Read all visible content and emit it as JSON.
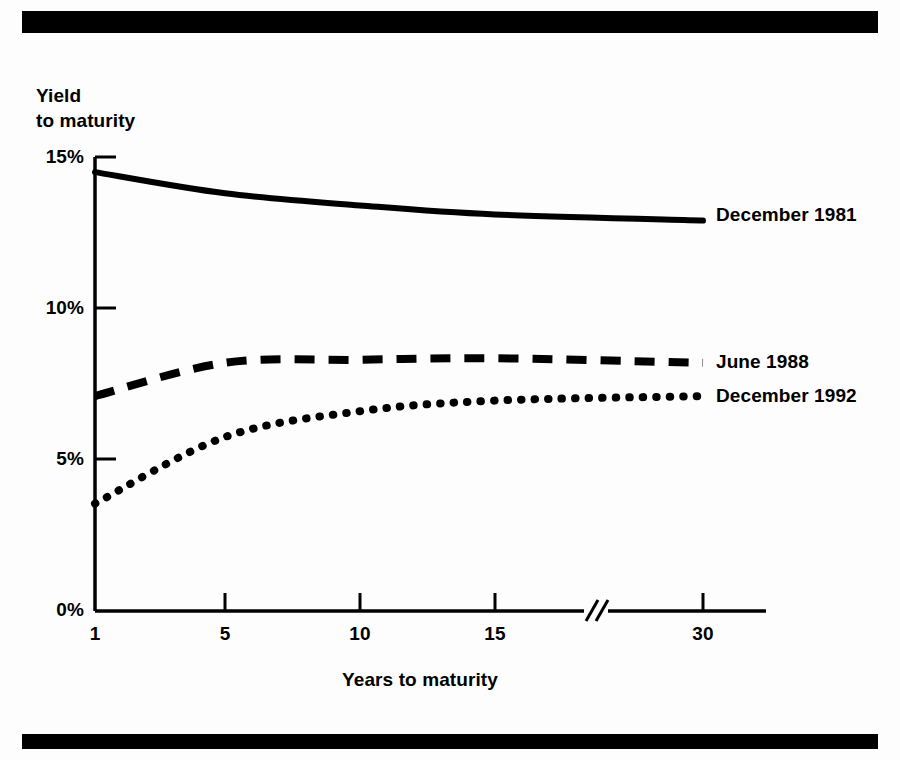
{
  "figure": {
    "y_axis_caption_line1": "Yield",
    "y_axis_caption_line2": "to maturity",
    "x_axis_caption": "Years to maturity"
  },
  "chart_data": {
    "type": "line",
    "title": "",
    "xlabel": "Years to maturity",
    "ylabel": "Yield to maturity",
    "x": [
      1,
      5,
      10,
      15,
      30
    ],
    "xticklabels": [
      "1",
      "5",
      "10",
      "15",
      "30"
    ],
    "yticklabels": [
      "0%",
      "5%",
      "10%",
      "15%"
    ],
    "ytickvalues": [
      0,
      5,
      10,
      15
    ],
    "ylim": [
      0,
      15
    ],
    "xlim": [
      1,
      30
    ],
    "grid": false,
    "axis_break": {
      "present": true,
      "between": [
        15,
        30
      ],
      "marker": "//"
    },
    "legend_position": "right-of-line-ends",
    "series": [
      {
        "name": "December 1981",
        "style": "solid",
        "values": [
          14.5,
          13.8,
          13.4,
          13.1,
          12.9
        ]
      },
      {
        "name": "June 1988",
        "style": "dashed",
        "values": [
          7.1,
          8.2,
          8.3,
          8.35,
          8.2
        ]
      },
      {
        "name": "December 1992",
        "style": "dotted",
        "values": [
          3.55,
          5.75,
          6.6,
          6.95,
          7.1
        ]
      }
    ]
  }
}
